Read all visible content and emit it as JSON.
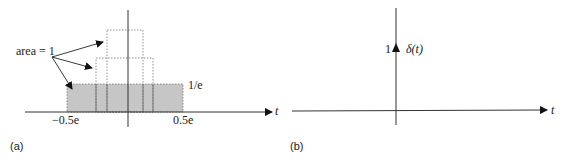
{
  "panel_a": {
    "caption": "(a)",
    "annotation": "area = 1",
    "height_label": "1/e",
    "x_left_label": "−0.5e",
    "x_right_label": "0.5e",
    "axis_label": "t",
    "colors": {
      "fill": "#c4c4c4",
      "axis": "#333333",
      "dotted": "#888888"
    },
    "rectangles": [
      {
        "name": "wide",
        "x_from": "-0.5e",
        "x_to": "0.5e",
        "height": "1/e",
        "filled": true
      },
      {
        "name": "medium",
        "filled": false
      },
      {
        "name": "narrow",
        "filled": false
      }
    ]
  },
  "panel_b": {
    "caption": "(b)",
    "impulse_weight": "1",
    "impulse_label": "δ(t)",
    "axis_label": "t"
  }
}
